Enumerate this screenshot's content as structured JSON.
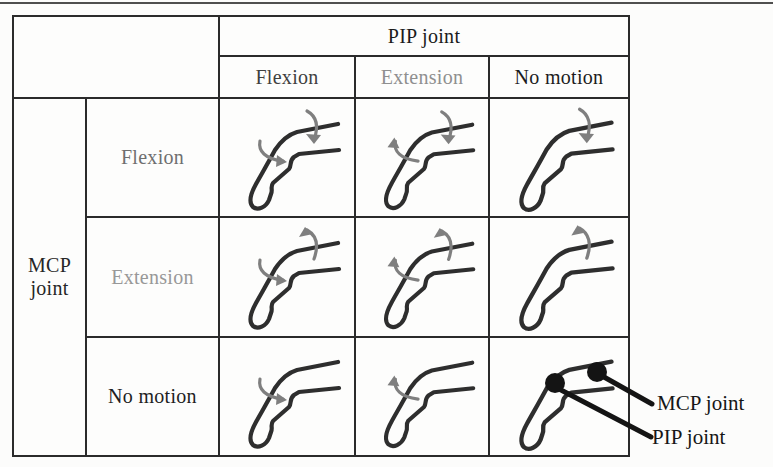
{
  "table": {
    "col_group_header": "PIP joint",
    "col_group_header_color": "#1b1b1b",
    "row_group_header": "MCP joint",
    "row_group_header_color": "#262626",
    "col_headers": [
      {
        "label": "Flexion",
        "color": "#3f3f3f"
      },
      {
        "label": "Extension",
        "color": "#8f8f8f"
      },
      {
        "label": "No motion",
        "color": "#1c1c1c"
      }
    ],
    "row_headers": [
      {
        "label": "Flexion",
        "color": "#6f6f6f"
      },
      {
        "label": "Extension",
        "color": "#989898"
      },
      {
        "label": "No motion",
        "color": "#1f1f1f"
      }
    ],
    "cells": [
      {
        "mcp": "Flexion",
        "pip": "Flexion",
        "mcp_arrow": "flexion",
        "pip_arrow": "flexion",
        "joint_dots": false
      },
      {
        "mcp": "Flexion",
        "pip": "Extension",
        "mcp_arrow": "flexion",
        "pip_arrow": "extension",
        "joint_dots": false
      },
      {
        "mcp": "Flexion",
        "pip": "No motion",
        "mcp_arrow": "flexion",
        "pip_arrow": "none",
        "joint_dots": false
      },
      {
        "mcp": "Extension",
        "pip": "Flexion",
        "mcp_arrow": "extension",
        "pip_arrow": "flexion",
        "joint_dots": false
      },
      {
        "mcp": "Extension",
        "pip": "Extension",
        "mcp_arrow": "extension",
        "pip_arrow": "extension",
        "joint_dots": false
      },
      {
        "mcp": "Extension",
        "pip": "No motion",
        "mcp_arrow": "extension",
        "pip_arrow": "none",
        "joint_dots": false
      },
      {
        "mcp": "No motion",
        "pip": "Flexion",
        "mcp_arrow": "none",
        "pip_arrow": "flexion",
        "joint_dots": false
      },
      {
        "mcp": "No motion",
        "pip": "Extension",
        "mcp_arrow": "none",
        "pip_arrow": "extension",
        "joint_dots": false
      },
      {
        "mcp": "No motion",
        "pip": "No motion",
        "mcp_arrow": "none",
        "pip_arrow": "none",
        "joint_dots": true
      }
    ]
  },
  "callouts": {
    "mcp_label": "MCP joint",
    "pip_label": "PIP joint"
  },
  "colors": {
    "finger_stroke": "#2e2e2e",
    "arrow": "#7f7f7f",
    "callout_ink": "#141414",
    "table_border": "#2b2b2b"
  }
}
